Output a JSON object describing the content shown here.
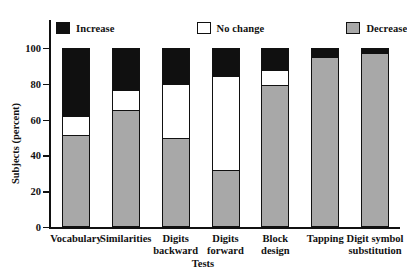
{
  "chart_data": {
    "type": "bar",
    "subtype": "stacked-vertical-100percent",
    "title": "",
    "xlabel": "Tests",
    "ylabel": "Subjects (percent)",
    "ylim": [
      0,
      100
    ],
    "yticks": [
      0,
      20,
      40,
      60,
      80,
      100
    ],
    "ytick_labels": [
      "0",
      "20",
      "40",
      "60",
      "80",
      "100"
    ],
    "grid": false,
    "legend_position": "top",
    "categories": [
      "Vocabulary",
      "Similarities",
      "Digits\nbackward",
      "Digits\nforward",
      "Block\ndesign",
      "Tapping",
      "Digit symbol\nsubstitution"
    ],
    "series": [
      {
        "name": "Decrease",
        "color": "#a8a8a8",
        "values": [
          51,
          65,
          49,
          31,
          79,
          95,
          97
        ]
      },
      {
        "name": "No change",
        "color": "#ffffff",
        "values": [
          11,
          12,
          31,
          54,
          9,
          0,
          0
        ]
      },
      {
        "name": "Increase",
        "color": "#101010",
        "values": [
          38,
          23,
          20,
          15,
          12,
          5,
          3
        ]
      }
    ]
  },
  "legend": {
    "entries": [
      {
        "label": "Increase",
        "swatch": "black"
      },
      {
        "label": "No change",
        "swatch": "white"
      },
      {
        "label": "Decrease",
        "swatch": "gray"
      }
    ]
  },
  "axes": {
    "y_title": "Subjects (percent)",
    "x_title": "Tests",
    "y_tick_labels": [
      "100",
      "80",
      "60",
      "40",
      "20",
      "0"
    ]
  }
}
